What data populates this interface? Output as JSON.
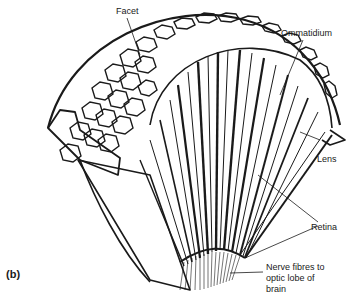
{
  "figure": {
    "panel_label": "(b)",
    "labels": {
      "facet": "Facet",
      "ommatidium": "Ommatidium",
      "lens": "Lens",
      "retina": "Retina",
      "nerve_line1": "Nerve fibres to",
      "nerve_line2": "optic lobe of",
      "nerve_line3": "brain"
    },
    "colors": {
      "ink": "#1a1a1a",
      "background": "#ffffff"
    }
  }
}
